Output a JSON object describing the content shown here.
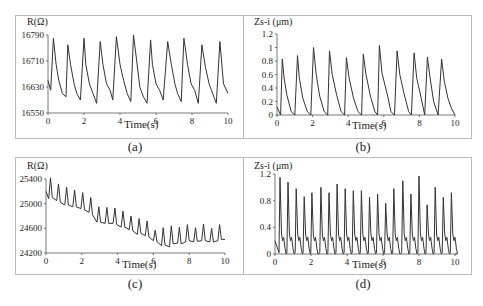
{
  "chart_data": [
    {
      "id": "a",
      "type": "line",
      "caption": "(a)",
      "title": "",
      "ylabel": "R(Ω)",
      "xlabel": "Time(s)",
      "xlim": [
        0,
        10
      ],
      "ylim": [
        16550,
        16790
      ],
      "xticks": [
        0,
        2,
        4,
        6,
        8,
        10
      ],
      "yticks": [
        16550,
        16630,
        16710,
        16790
      ],
      "grid": false,
      "description": "Periodic resistance signal, ~11 cycles, peaks ~16770-16785, troughs ~16580-16600",
      "x": [
        0,
        0.15,
        0.3,
        0.45,
        0.6,
        0.8,
        1.0,
        1.1,
        1.25,
        1.45,
        1.6,
        1.8,
        2.0,
        2.1,
        2.3,
        2.5,
        2.7,
        2.9,
        3.05,
        3.25,
        3.45,
        3.6,
        3.8,
        4.0,
        4.2,
        4.4,
        4.6,
        4.75,
        4.95,
        5.1,
        5.3,
        5.5,
        5.7,
        5.8,
        6.0,
        6.2,
        6.4,
        6.65,
        6.85,
        7.05,
        7.2,
        7.4,
        7.55,
        7.75,
        7.95,
        8.15,
        8.35,
        8.55,
        8.75,
        8.95,
        9.15,
        9.35,
        9.55,
        9.75,
        10.0
      ],
      "values": [
        16650,
        16620,
        16780,
        16700,
        16650,
        16610,
        16600,
        16760,
        16700,
        16640,
        16610,
        16590,
        16780,
        16700,
        16640,
        16610,
        16580,
        16770,
        16700,
        16640,
        16620,
        16590,
        16785,
        16700,
        16650,
        16610,
        16585,
        16790,
        16700,
        16630,
        16600,
        16580,
        16775,
        16700,
        16640,
        16620,
        16590,
        16770,
        16700,
        16640,
        16610,
        16585,
        16780,
        16700,
        16640,
        16620,
        16580,
        16760,
        16690,
        16640,
        16610,
        16580,
        16770,
        16640,
        16610
      ]
    },
    {
      "id": "b",
      "type": "line",
      "caption": "(b)",
      "title": "",
      "ylabel": "Zs-i (μm)",
      "xlabel": "Time(s)",
      "xlim": [
        0,
        10
      ],
      "ylim": [
        0,
        1.2
      ],
      "xticks": [
        0,
        2,
        4,
        6,
        8,
        10
      ],
      "yticks": [
        0,
        0.2,
        0.4,
        0.6,
        0.8,
        1.0,
        1.2
      ],
      "ytick_labels": [
        "0",
        "0.2",
        "0.4",
        "0.6",
        "0.8",
        "1",
        "1.2"
      ],
      "grid": false,
      "description": "Periodic displacement, ~11 cycles, peaks 0.83-1.0, troughs ~0",
      "x": [
        0,
        0.2,
        0.3,
        0.4,
        0.55,
        0.8,
        1.0,
        1.15,
        1.25,
        1.45,
        1.7,
        1.9,
        2.05,
        2.2,
        2.4,
        2.65,
        2.85,
        2.95,
        3.1,
        3.35,
        3.6,
        3.8,
        3.9,
        4.05,
        4.3,
        4.55,
        4.75,
        4.85,
        5.0,
        5.25,
        5.5,
        5.65,
        5.75,
        5.9,
        6.2,
        6.4,
        6.6,
        6.75,
        6.9,
        7.15,
        7.4,
        7.55,
        7.7,
        7.85,
        8.1,
        8.3,
        8.45,
        8.6,
        8.8,
        9.05,
        9.25,
        9.4,
        9.6,
        9.8,
        10.0
      ],
      "values": [
        0.12,
        0.0,
        0.83,
        0.55,
        0.3,
        0.05,
        0.0,
        0.88,
        0.55,
        0.25,
        0.05,
        0.0,
        1.0,
        0.6,
        0.28,
        0.05,
        0.0,
        0.95,
        0.6,
        0.3,
        0.05,
        0.0,
        0.85,
        0.55,
        0.25,
        0.05,
        0.0,
        0.9,
        0.6,
        0.28,
        0.05,
        0.0,
        1.03,
        0.62,
        0.3,
        0.05,
        0.0,
        0.95,
        0.6,
        0.3,
        0.05,
        0.0,
        0.92,
        0.55,
        0.25,
        0.0,
        0.86,
        0.55,
        0.2,
        0.0,
        0.83,
        0.5,
        0.25,
        0.1,
        0.0
      ]
    },
    {
      "id": "c",
      "type": "line",
      "caption": "(c)",
      "title": "",
      "ylabel": "R(Ω)",
      "xlabel": "Time(s)",
      "xlim": [
        0,
        10
      ],
      "ylim": [
        24200,
        25400
      ],
      "xticks": [
        0,
        2,
        4,
        6,
        8,
        10
      ],
      "yticks": [
        24200,
        24600,
        25000,
        25400
      ],
      "grid": false,
      "description": "Resistance with sharp periodic spikes (~22 cycles) and a declining baseline from ~25100 to ~24400",
      "x": [
        0,
        0.15,
        0.25,
        0.35,
        0.6,
        0.7,
        0.8,
        1.05,
        1.15,
        1.25,
        1.5,
        1.6,
        1.7,
        1.95,
        2.05,
        2.15,
        2.4,
        2.5,
        2.6,
        2.85,
        2.95,
        3.05,
        3.3,
        3.4,
        3.5,
        3.75,
        3.85,
        3.95,
        4.2,
        4.3,
        4.4,
        4.65,
        4.75,
        4.85,
        5.1,
        5.2,
        5.3,
        5.55,
        5.65,
        5.75,
        6.0,
        6.1,
        6.2,
        6.45,
        6.55,
        6.65,
        6.9,
        7.0,
        7.1,
        7.35,
        7.45,
        7.55,
        7.8,
        7.9,
        8.0,
        8.25,
        8.35,
        8.45,
        8.7,
        8.8,
        8.9,
        9.15,
        9.25,
        9.35,
        9.6,
        9.7,
        9.8,
        10.0
      ],
      "values": [
        25200,
        25080,
        25420,
        25100,
        25050,
        25320,
        25020,
        24980,
        25270,
        24980,
        24950,
        25220,
        24950,
        24920,
        25180,
        24900,
        24860,
        25100,
        24820,
        24700,
        24950,
        24700,
        24680,
        24940,
        24680,
        24680,
        24930,
        24660,
        24620,
        24880,
        24620,
        24580,
        24800,
        24560,
        24500,
        24760,
        24520,
        24480,
        24720,
        24460,
        24400,
        24570,
        24380,
        24320,
        24610,
        24330,
        24300,
        24640,
        24350,
        24360,
        24620,
        24350,
        24380,
        24660,
        24400,
        24380,
        24610,
        24390,
        24400,
        24670,
        24400,
        24380,
        24600,
        24380,
        24400,
        24660,
        24420,
        24420
      ]
    },
    {
      "id": "d",
      "type": "line",
      "caption": "(d)",
      "title": "",
      "ylabel": "Zs-i (μm)",
      "xlabel": "Time(s)",
      "xlim": [
        0,
        10
      ],
      "ylim": [
        0,
        1.2
      ],
      "xticks": [
        0,
        2,
        4,
        6,
        8,
        10
      ],
      "yticks": [
        0,
        0.4,
        0.8,
        1.2
      ],
      "ytick_labels": [
        "0",
        "0.4",
        "0.8",
        "1.2"
      ],
      "grid": false,
      "description": "Displacement with sharp spikes (~22 cycles), peaks 0.75-1.17, baseline 0-0.3",
      "peaks": [
        {
          "t": 0.28,
          "v": 1.15
        },
        {
          "t": 0.72,
          "v": 1.08
        },
        {
          "t": 1.18,
          "v": 0.98
        },
        {
          "t": 1.62,
          "v": 0.86
        },
        {
          "t": 2.05,
          "v": 0.92
        },
        {
          "t": 2.55,
          "v": 1.0
        },
        {
          "t": 3.0,
          "v": 0.92
        },
        {
          "t": 3.45,
          "v": 1.05
        },
        {
          "t": 3.9,
          "v": 0.98
        },
        {
          "t": 4.35,
          "v": 0.95
        },
        {
          "t": 4.8,
          "v": 0.95
        },
        {
          "t": 5.25,
          "v": 0.85
        },
        {
          "t": 5.7,
          "v": 0.9
        },
        {
          "t": 6.15,
          "v": 0.76
        },
        {
          "t": 6.6,
          "v": 0.98
        },
        {
          "t": 7.1,
          "v": 1.1
        },
        {
          "t": 7.55,
          "v": 0.9
        },
        {
          "t": 8.0,
          "v": 1.17
        },
        {
          "t": 8.45,
          "v": 0.74
        },
        {
          "t": 8.9,
          "v": 1.0
        },
        {
          "t": 9.35,
          "v": 0.85
        },
        {
          "t": 9.8,
          "v": 0.92
        }
      ]
    }
  ],
  "panels": {
    "a": {
      "caption": "(a)",
      "ylabel": "R(Ω)",
      "xlabel": "Time(s)"
    },
    "b": {
      "caption": "(b)",
      "ylabel": "Zs-i (μm)",
      "xlabel": "Time(s)"
    },
    "c": {
      "caption": "(c)",
      "ylabel": "R(Ω)",
      "xlabel": "Time(s)"
    },
    "d": {
      "caption": "(d)",
      "ylabel": "Zs-i (μm)",
      "xlabel": "Time(s)"
    }
  },
  "colors": {
    "line": "#333333",
    "axis": "#555555",
    "frame": "#b9b9b9"
  }
}
